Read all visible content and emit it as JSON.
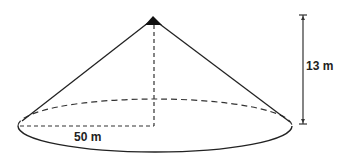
{
  "diagram": {
    "shape": "cone",
    "labels": {
      "height": "13 m",
      "radius": "50 m"
    },
    "colors": {
      "stroke": "#222222",
      "background": "#ffffff"
    }
  }
}
